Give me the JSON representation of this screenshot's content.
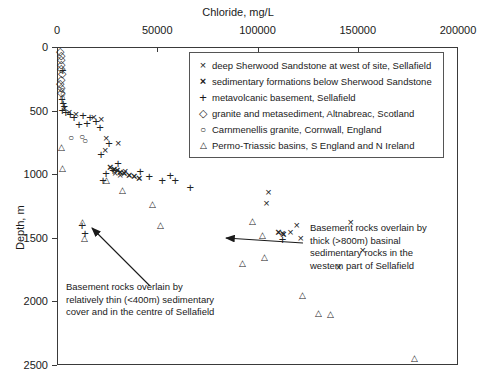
{
  "chart_data": {
    "type": "scatter",
    "title": "",
    "xlabel": "Chloride, mg/L",
    "ylabel": "Depth, m",
    "xlim": [
      0,
      200000
    ],
    "ylim": [
      2500,
      0
    ],
    "y_inverted": true,
    "grid": false,
    "xticks": [
      0,
      50000,
      100000,
      150000,
      200000
    ],
    "yticks": [
      0,
      500,
      1000,
      1500,
      2000,
      2500
    ],
    "legend_position": "top-right-inside",
    "series": [
      {
        "name": "deep Sherwood Sandstone at west of site, Sellafield",
        "marker": "x",
        "points": [
          [
            3200,
            470
          ],
          [
            5600,
            505
          ],
          [
            8900,
            520
          ],
          [
            17800,
            545
          ],
          [
            21500,
            560
          ],
          [
            24000,
            710
          ],
          [
            30000,
            745
          ],
          [
            23500,
            800
          ],
          [
            28500,
            980
          ],
          [
            31000,
            1000
          ],
          [
            33500,
            965
          ],
          [
            105000,
            1130
          ],
          [
            104000,
            1215
          ],
          [
            119000,
            1390
          ],
          [
            116000,
            1450
          ],
          [
            121000,
            1490
          ],
          [
            112000,
            1455
          ],
          [
            146000,
            1365
          ],
          [
            152000,
            1585
          ],
          [
            140000,
            1720
          ]
        ]
      },
      {
        "name": "sedimentary formations below Sherwood Sandstone",
        "marker": "x-bold",
        "points": [
          [
            26000,
            935
          ],
          [
            28000,
            950
          ],
          [
            29500,
            960
          ],
          [
            31000,
            975
          ],
          [
            33000,
            985
          ],
          [
            35500,
            995
          ],
          [
            38000,
            1010
          ],
          [
            40500,
            1020
          ],
          [
            110000,
            1450
          ],
          [
            112500,
            1460
          ]
        ]
      },
      {
        "name": "metavolcanic basement, Sellafield",
        "marker": "plus",
        "points": [
          [
            2400,
            170
          ],
          [
            2000,
            400
          ],
          [
            2600,
            430
          ],
          [
            3100,
            455
          ],
          [
            2200,
            490
          ],
          [
            3900,
            500
          ],
          [
            6100,
            520
          ],
          [
            8000,
            545
          ],
          [
            12500,
            525
          ],
          [
            16000,
            545
          ],
          [
            19000,
            570
          ],
          [
            14500,
            590
          ],
          [
            10500,
            600
          ],
          [
            21000,
            620
          ],
          [
            25500,
            745
          ],
          [
            21500,
            830
          ],
          [
            30000,
            905
          ],
          [
            27500,
            960
          ],
          [
            24000,
            980
          ],
          [
            22500,
            1035
          ],
          [
            41000,
            965
          ],
          [
            45500,
            1010
          ],
          [
            52000,
            1035
          ],
          [
            56000,
            1000
          ],
          [
            58500,
            1040
          ],
          [
            66000,
            1095
          ],
          [
            12000,
            1390
          ],
          [
            13500,
            1455
          ],
          [
            112000,
            1500
          ]
        ]
      },
      {
        "name": "granite and metasediment, Altnabreac, Scotland",
        "marker": "diamond",
        "points": [
          [
            1100,
            20
          ],
          [
            1500,
            55
          ],
          [
            1300,
            90
          ],
          [
            1700,
            125
          ],
          [
            1400,
            160
          ],
          [
            1800,
            200
          ],
          [
            1500,
            240
          ],
          [
            1200,
            275
          ],
          [
            1600,
            310
          ],
          [
            1400,
            345
          ]
        ]
      },
      {
        "name": "Carnmenellis granite, Cornwall, England",
        "marker": "circle",
        "points": [
          [
            1900,
            330
          ],
          [
            2400,
            360
          ],
          [
            2100,
            395
          ],
          [
            6500,
            710
          ],
          [
            12000,
            700
          ],
          [
            13500,
            730
          ]
        ]
      },
      {
        "name": "Permo-Triassic basins, S England and N Ireland",
        "marker": "triangle",
        "points": [
          [
            1800,
            780
          ],
          [
            2200,
            940
          ],
          [
            24000,
            1040
          ],
          [
            32000,
            1120
          ],
          [
            12000,
            1370
          ],
          [
            13000,
            1490
          ],
          [
            47000,
            1225
          ],
          [
            51000,
            1395
          ],
          [
            97000,
            1360
          ],
          [
            102000,
            1470
          ],
          [
            103000,
            1640
          ],
          [
            92000,
            1690
          ],
          [
            122000,
            1945
          ],
          [
            130000,
            2085
          ],
          [
            136000,
            2090
          ],
          [
            178000,
            2435
          ]
        ]
      }
    ],
    "annotations": [
      {
        "name": "thin-cover-annotation",
        "lines": [
          "Basement rocks overlain by",
          "relatively thin (<400m) sedimentary",
          "cover and in the centre of Sellafield"
        ],
        "arrow_from": [
          150,
          286
        ],
        "arrow_to": [
          92,
          228
        ]
      },
      {
        "name": "thick-basinal-annotation",
        "lines": [
          "Basement rocks overlain by",
          "thick (>800m) basinal",
          "sedimentary rocks in the",
          "western part of Sellafield"
        ],
        "arrow_from": [
          303,
          243
        ],
        "arrow_to": [
          226,
          238
        ]
      }
    ]
  }
}
